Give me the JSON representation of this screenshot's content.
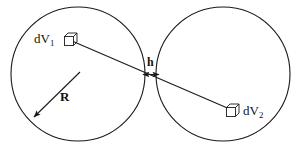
{
  "figure": {
    "background_color": "#ffffff",
    "stroke_color": "#1a1a1a",
    "labels": {
      "dv1_prefix": "dV",
      "dv1_subscript": "1",
      "dv2_prefix": "dV",
      "dv2_subscript": "2",
      "gap": "h",
      "radius": "R"
    },
    "icons": {
      "volume_element_1": "cube-icon",
      "volume_element_2": "cube-icon",
      "radius_arrow": "arrow-icon",
      "gap_arrow": "double-arrow-icon"
    },
    "geometry": {
      "left_circle": {
        "cx": 78,
        "cy": 74,
        "r": 67
      },
      "right_circle": {
        "cx": 223,
        "cy": 74,
        "r": 67
      },
      "gap_left_x": 145,
      "gap_right_x": 157,
      "gap_y": 74,
      "connector_start": {
        "x": 72,
        "y": 41
      },
      "connector_end": {
        "x": 232,
        "y": 110
      },
      "radius_line_start": {
        "x": 78,
        "y": 74
      },
      "radius_line_end": {
        "x": 33,
        "y": 118
      },
      "cube1": {
        "x": 64,
        "y": 33,
        "size": 13
      },
      "cube2": {
        "x": 226,
        "y": 104,
        "size": 13
      }
    }
  }
}
